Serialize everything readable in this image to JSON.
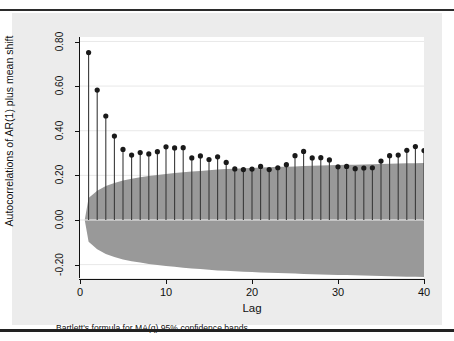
{
  "figure": {
    "background_color": "#ececec",
    "plot_background_color": "#ffffff",
    "note": "Bartlett's formula for MA(q) 95% confidence bands"
  },
  "chart_data": {
    "type": "bar",
    "chart_subtype": "autocorrelation-stem-plot",
    "title": "",
    "xlabel": "Lag",
    "ylabel": "Autocorrelations of AR(1) plus mean shift",
    "xlim": [
      0,
      40
    ],
    "ylim": [
      -0.26,
      0.82
    ],
    "xticks": [
      0,
      10,
      20,
      30,
      40
    ],
    "xtick_labels": [
      "0",
      "10",
      "20",
      "30",
      "40"
    ],
    "yticks": [
      0.8,
      0.6,
      0.4,
      0.2,
      0.0,
      -0.2
    ],
    "ytick_labels": [
      "0.80",
      "0.60",
      "0.40",
      "0.20",
      "0.00",
      "-0.20"
    ],
    "grid": true,
    "grid_color": "#e8e8e8",
    "legend": "none",
    "marker_color": "#1a1a1a",
    "stem_color": "#3a3a3a",
    "band_color": "#999999",
    "band_label": "Bartlett's formula for MA(q) 95% confidence bands",
    "categories": [
      1,
      2,
      3,
      4,
      5,
      6,
      7,
      8,
      9,
      10,
      11,
      12,
      13,
      14,
      15,
      16,
      17,
      18,
      19,
      20,
      21,
      22,
      23,
      24,
      25,
      26,
      27,
      28,
      29,
      30,
      31,
      32,
      33,
      34,
      35,
      36,
      37,
      38,
      39,
      40
    ],
    "values": [
      0.75,
      0.582,
      0.466,
      0.376,
      0.316,
      0.291,
      0.302,
      0.296,
      0.306,
      0.328,
      0.323,
      0.324,
      0.278,
      0.287,
      0.271,
      0.283,
      0.258,
      0.229,
      0.226,
      0.228,
      0.24,
      0.226,
      0.234,
      0.248,
      0.288,
      0.307,
      0.278,
      0.279,
      0.269,
      0.238,
      0.24,
      0.23,
      0.233,
      0.234,
      0.264,
      0.288,
      0.291,
      0.312,
      0.329,
      0.311
    ],
    "series": [
      {
        "name": "Autocorrelation",
        "values": [
          0.75,
          0.582,
          0.466,
          0.376,
          0.316,
          0.291,
          0.302,
          0.296,
          0.306,
          0.328,
          0.323,
          0.324,
          0.278,
          0.287,
          0.271,
          0.283,
          0.258,
          0.229,
          0.226,
          0.228,
          0.24,
          0.226,
          0.234,
          0.248,
          0.288,
          0.307,
          0.278,
          0.279,
          0.269,
          0.238,
          0.24,
          0.23,
          0.233,
          0.234,
          0.264,
          0.288,
          0.291,
          0.312,
          0.329,
          0.311
        ]
      },
      {
        "name": "Bartlett 95% upper band",
        "values": [
          0.098,
          0.131,
          0.152,
          0.166,
          0.177,
          0.185,
          0.191,
          0.197,
          0.202,
          0.206,
          0.21,
          0.214,
          0.217,
          0.22,
          0.223,
          0.226,
          0.228,
          0.23,
          0.232,
          0.233,
          0.235,
          0.236,
          0.238,
          0.239,
          0.24,
          0.242,
          0.243,
          0.244,
          0.245,
          0.246,
          0.247,
          0.248,
          0.249,
          0.25,
          0.251,
          0.252,
          0.253,
          0.254,
          0.254,
          0.255
        ]
      },
      {
        "name": "Bartlett 95% lower band",
        "values": [
          -0.098,
          -0.131,
          -0.152,
          -0.166,
          -0.177,
          -0.185,
          -0.191,
          -0.197,
          -0.202,
          -0.206,
          -0.21,
          -0.214,
          -0.217,
          -0.22,
          -0.223,
          -0.226,
          -0.228,
          -0.23,
          -0.232,
          -0.233,
          -0.235,
          -0.236,
          -0.238,
          -0.239,
          -0.24,
          -0.242,
          -0.243,
          -0.244,
          -0.245,
          -0.246,
          -0.247,
          -0.248,
          -0.249,
          -0.25,
          -0.251,
          -0.252,
          -0.253,
          -0.254,
          -0.254,
          -0.255
        ]
      }
    ]
  }
}
